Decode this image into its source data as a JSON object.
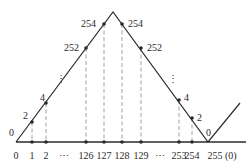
{
  "diagram": {
    "type": "triangle-wave mapping",
    "colors": {
      "line": "#2a2a2a",
      "dashed": "#9a9a9a",
      "text": "#2a2a2a",
      "background": "#ffffff"
    },
    "x_axis_labels": [
      "0",
      "1",
      "2",
      "⋯",
      "126",
      "127",
      "128",
      "129",
      "⋯",
      "253",
      "254",
      "255 (0)"
    ],
    "point_labels": {
      "left_0": "0",
      "left_2": "2",
      "left_4": "4",
      "left_dots": "⋮",
      "left_252": "252",
      "left_254": "254",
      "right_254": "254",
      "right_252": "252",
      "right_dots": "⋮",
      "right_4": "4",
      "right_2": "2",
      "right_0": "0"
    },
    "points": [
      {
        "x_label": "1",
        "value": 2
      },
      {
        "x_label": "2",
        "value": 4
      },
      {
        "x_label": "126",
        "value": 252
      },
      {
        "x_label": "127",
        "value": 254
      },
      {
        "x_label": "128",
        "value": 254
      },
      {
        "x_label": "129",
        "value": 252
      },
      {
        "x_label": "253",
        "value": 4
      },
      {
        "x_label": "254",
        "value": 2
      },
      {
        "x_label": "255 (0)",
        "value": 0
      }
    ]
  }
}
